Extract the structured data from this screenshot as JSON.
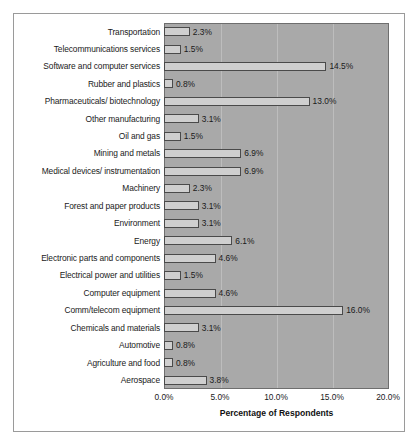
{
  "chart_data": {
    "type": "bar",
    "orientation": "horizontal",
    "title": "",
    "xlabel": "Percentage of Respondents",
    "ylabel": "",
    "xlim": [
      0,
      20
    ],
    "xticks": [
      "0.0%",
      "5.0%",
      "10.0%",
      "15.0%",
      "20.0%"
    ],
    "xtick_values": [
      0,
      5,
      10,
      15,
      20
    ],
    "grid": true,
    "grid_axis": "x",
    "legend": "none",
    "categories": [
      "Transportation",
      "Telecommunications services",
      "Software and computer services",
      "Rubber and plastics",
      "Pharmaceuticals/ biotechnology",
      "Other manufacturing",
      "Oil and gas",
      "Mining and metals",
      "Medical devices/ instrumentation",
      "Machinery",
      "Forest and paper products",
      "Environment",
      "Energy",
      "Electronic parts and components",
      "Electrical power and utilities",
      "Computer equipment",
      "Comm/telecom equipment",
      "Chemicals and materials",
      "Automotive",
      "Agriculture and food",
      "Aerospace"
    ],
    "values": [
      2.3,
      1.5,
      14.5,
      0.8,
      13.0,
      3.1,
      1.5,
      6.9,
      6.9,
      2.3,
      3.1,
      3.1,
      6.1,
      4.6,
      1.5,
      4.6,
      16.0,
      3.1,
      0.8,
      0.8,
      3.8
    ],
    "value_labels": [
      "2.3%",
      "1.5%",
      "14.5%",
      "0.8%",
      "13.0%",
      "3.1%",
      "1.5%",
      "6.9%",
      "6.9%",
      "2.3%",
      "3.1%",
      "3.1%",
      "6.1%",
      "4.6%",
      "1.5%",
      "4.6%",
      "16.0%",
      "3.1%",
      "0.8%",
      "0.8%",
      "3.8%"
    ],
    "colors": {
      "bar_fill": "#cfcfcf",
      "bar_border": "#4a4a4a",
      "plot_background": "#a9a9a9",
      "gridline": "#bdbdbd",
      "axis": "#6e6e6e",
      "frame_border": "#9a9a9a",
      "text": "#1a1a1a",
      "page_background": "#ffffff"
    }
  }
}
